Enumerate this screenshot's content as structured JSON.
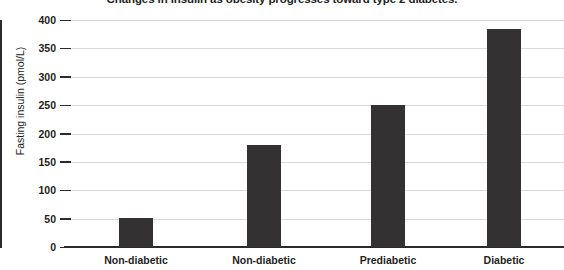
{
  "chart_data": {
    "type": "bar",
    "title": "Changes in insulin as obesity progresses toward type 2 diabetes.",
    "xlabel": "",
    "ylabel": "Fasting insulin (pmol/L)",
    "categories": [
      "Non-diabetic",
      "Non-diabetic",
      "Prediabetic",
      "Diabetic"
    ],
    "values": [
      52,
      180,
      250,
      385
    ],
    "ylim": [
      0,
      400
    ],
    "yticks": [
      0,
      50,
      100,
      150,
      200,
      250,
      300,
      350,
      400
    ],
    "ytick_labels": [
      "0",
      "50",
      "100",
      "150",
      "200",
      "250",
      "300",
      "350",
      "400"
    ],
    "grid": true,
    "legend": false,
    "bar_color": "#333132",
    "gridline_color": "#d9d9d9",
    "axis_color": "#2b2b2b"
  }
}
